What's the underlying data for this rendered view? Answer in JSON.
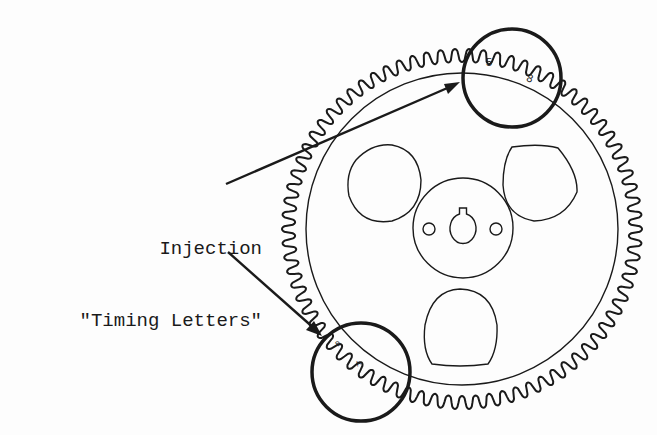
{
  "diagram": {
    "label": {
      "line1": "Injection",
      "line2": "\"Timing Letters\""
    },
    "timing_marks": {
      "top": [
        "5",
        "8"
      ],
      "bottom": [
        "B",
        "A"
      ]
    },
    "gear": {
      "tooth_count": 78,
      "callout_circles": 2,
      "lobe_holes": 3,
      "bolt_holes": 2
    },
    "colors": {
      "ink": "#1a1a1a",
      "background": "#fdfdfd"
    }
  }
}
